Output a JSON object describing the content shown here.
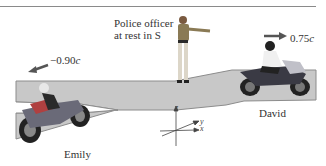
{
  "figure": {
    "officer_label_line1": "Police officer",
    "officer_label_line2": "at rest in S",
    "emily": {
      "name": "Emily",
      "velocity_value": "−0.90",
      "velocity_unit": "c",
      "arrow_direction": "left"
    },
    "david": {
      "name": "David",
      "velocity_value": "0.75",
      "velocity_unit": "c",
      "arrow_direction": "right"
    },
    "axes": {
      "x": "x",
      "y": "y",
      "z": "z"
    }
  },
  "colors": {
    "road": "#c8c8c8",
    "road_edge": "#8c8c8c",
    "arrow": "#555555",
    "text": "#333333"
  }
}
